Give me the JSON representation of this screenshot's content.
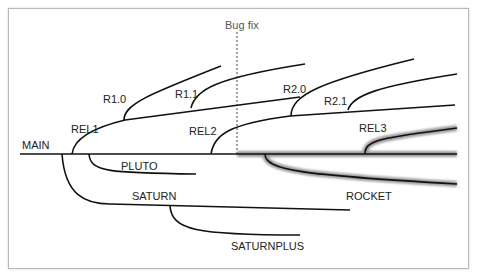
{
  "diagram": {
    "annotation": "Bug fix",
    "branches": [
      {
        "name": "MAIN",
        "label": "MAIN"
      },
      {
        "name": "REL1",
        "label": "REL1"
      },
      {
        "name": "R1.0",
        "label": "R1.0"
      },
      {
        "name": "R1.1",
        "label": "R1.1"
      },
      {
        "name": "REL2",
        "label": "REL2"
      },
      {
        "name": "R2.0",
        "label": "R2.0"
      },
      {
        "name": "R2.1",
        "label": "R2.1"
      },
      {
        "name": "REL3",
        "label": "REL3"
      },
      {
        "name": "PLUTO",
        "label": "PLUTO"
      },
      {
        "name": "SATURN",
        "label": "SATURN"
      },
      {
        "name": "SATURNPLUS",
        "label": "SATURNPLUS"
      },
      {
        "name": "ROCKET",
        "label": "ROCKET"
      }
    ],
    "colors": {
      "line": "#111111",
      "highlight_halo": "#9a9a9a",
      "frame": "#b8b8b8",
      "dashed": "#444444"
    }
  }
}
